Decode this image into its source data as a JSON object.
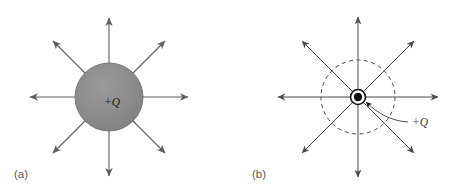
{
  "figure": {
    "background_color": "#ffffff",
    "panels": [
      {
        "id": "panel-a",
        "caption": "(a)",
        "caption_x": 14,
        "caption_y": 178,
        "center_x": 109,
        "center_y": 97,
        "charge_label": "+Q",
        "charge_label_x": 104,
        "charge_label_y": 106,
        "sphere": {
          "radius": 34,
          "fill_color": "#8b8b8b",
          "stroke_color": "#6e6e6e"
        },
        "field_lines": {
          "count": 8,
          "start_radius": 0,
          "tip_radius": 81,
          "stroke_color": "#5e5e5e",
          "stroke_width": 1.1,
          "angles_deg": [
            0,
            45,
            90,
            135,
            180,
            225,
            270,
            315
          ]
        }
      },
      {
        "id": "panel-b",
        "caption": "(b)",
        "caption_x": 252,
        "caption_y": 178,
        "center_x": 358,
        "center_y": 97,
        "charge_label": "+Q",
        "charge_label_x": 412,
        "charge_label_y": 126,
        "point_charge": {
          "dot_radius": 4.2,
          "ring_radius": 7.5,
          "fill_color": "#101010",
          "ring_color": "#101010"
        },
        "dashed_circle": {
          "radius": 37,
          "stroke_color": "#4a4a4a",
          "dash_pattern": "4,3.5"
        },
        "field_lines": {
          "count": 8,
          "tip_radius": 82,
          "stroke_color": "#4a4a4a",
          "stroke_width": 1.0,
          "angles_deg": [
            0,
            45,
            90,
            135,
            180,
            225,
            270,
            315
          ]
        },
        "leader_line": {
          "stroke_color": "#3a3a3a",
          "from_x": 408,
          "from_y": 122,
          "to_x": 366,
          "to_y": 102
        }
      }
    ]
  }
}
